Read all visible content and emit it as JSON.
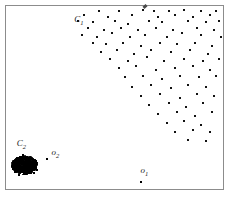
{
  "chart_data": {
    "type": "scatter",
    "title": "",
    "xlabel": "",
    "ylabel": "",
    "xlim": [
      0,
      100
    ],
    "ylim": [
      0,
      100
    ],
    "grid": false,
    "legend": null,
    "annotations": [
      {
        "name": "C1",
        "text": "C",
        "subscript": "1",
        "x": 31.5,
        "y": 91.0
      },
      {
        "name": "C2",
        "text": "C",
        "subscript": "2",
        "x": 5.0,
        "y": 23.5
      },
      {
        "name": "o2",
        "text": "o",
        "subscript": "2",
        "x": 21.0,
        "y": 18.5
      },
      {
        "name": "o1",
        "text": "o",
        "subscript": "1",
        "x": 62.0,
        "y": 9.0
      }
    ],
    "series": [
      {
        "name": "C1",
        "marker": "square",
        "color": "#121212",
        "size": 2,
        "points": [
          [
            43,
            97
          ],
          [
            52,
            97
          ],
          [
            63,
            98
          ],
          [
            68,
            97
          ],
          [
            75,
            97
          ],
          [
            82,
            98
          ],
          [
            90,
            97
          ],
          [
            97,
            97
          ],
          [
            36,
            95
          ],
          [
            47,
            94
          ],
          [
            58,
            95
          ],
          [
            70,
            94
          ],
          [
            78,
            95
          ],
          [
            86,
            94
          ],
          [
            94,
            95
          ],
          [
            33,
            92
          ],
          [
            40,
            91
          ],
          [
            50,
            92
          ],
          [
            56,
            90
          ],
          [
            66,
            92
          ],
          [
            72,
            91
          ],
          [
            84,
            92
          ],
          [
            92,
            91
          ],
          [
            98,
            92
          ],
          [
            38,
            88
          ],
          [
            45,
            87
          ],
          [
            53,
            88
          ],
          [
            61,
            87
          ],
          [
            69,
            88
          ],
          [
            77,
            87
          ],
          [
            88,
            88
          ],
          [
            96,
            87
          ],
          [
            35,
            84
          ],
          [
            42,
            83
          ],
          [
            49,
            85
          ],
          [
            57,
            83
          ],
          [
            64,
            84
          ],
          [
            74,
            83
          ],
          [
            81,
            85
          ],
          [
            90,
            84
          ],
          [
            99,
            83
          ],
          [
            40,
            80
          ],
          [
            46,
            79
          ],
          [
            54,
            80
          ],
          [
            62,
            78
          ],
          [
            71,
            80
          ],
          [
            79,
            79
          ],
          [
            87,
            80
          ],
          [
            95,
            78
          ],
          [
            44,
            75
          ],
          [
            51,
            76
          ],
          [
            59,
            74
          ],
          [
            67,
            76
          ],
          [
            76,
            75
          ],
          [
            85,
            76
          ],
          [
            93,
            74
          ],
          [
            48,
            71
          ],
          [
            56,
            70
          ],
          [
            65,
            72
          ],
          [
            73,
            70
          ],
          [
            82,
            71
          ],
          [
            91,
            70
          ],
          [
            98,
            71
          ],
          [
            52,
            66
          ],
          [
            60,
            67
          ],
          [
            69,
            65
          ],
          [
            78,
            66
          ],
          [
            86,
            67
          ],
          [
            94,
            65
          ],
          [
            55,
            61
          ],
          [
            63,
            62
          ],
          [
            72,
            60
          ],
          [
            80,
            62
          ],
          [
            89,
            61
          ],
          [
            97,
            62
          ],
          [
            58,
            56
          ],
          [
            67,
            57
          ],
          [
            76,
            55
          ],
          [
            84,
            57
          ],
          [
            92,
            56
          ],
          [
            62,
            51
          ],
          [
            71,
            52
          ],
          [
            80,
            50
          ],
          [
            88,
            52
          ],
          [
            96,
            51
          ],
          [
            66,
            46
          ],
          [
            75,
            47
          ],
          [
            83,
            45
          ],
          [
            91,
            47
          ],
          [
            70,
            41
          ],
          [
            79,
            42
          ],
          [
            87,
            40
          ],
          [
            95,
            42
          ],
          [
            74,
            36
          ],
          [
            82,
            37
          ],
          [
            90,
            35
          ],
          [
            78,
            31
          ],
          [
            86,
            32
          ],
          [
            94,
            31
          ],
          [
            84,
            27
          ],
          [
            92,
            26
          ]
        ]
      },
      {
        "name": "C2",
        "marker": "dense-blob",
        "color": "#000000",
        "point_count": 420,
        "center": [
          8.5,
          13.0
        ],
        "radius": 5.5,
        "note": "Extremely dense cluster rendered as a near-solid black mass"
      },
      {
        "name": "outliers",
        "marker": "square",
        "color": "#000000",
        "size": 2,
        "points": [
          [
            19.0,
            16.5
          ],
          [
            62.0,
            4.0
          ]
        ]
      }
    ]
  },
  "figure": {
    "frame_color": "#8c8c8c",
    "background": "#ffffff",
    "marker_color": "#121212"
  }
}
